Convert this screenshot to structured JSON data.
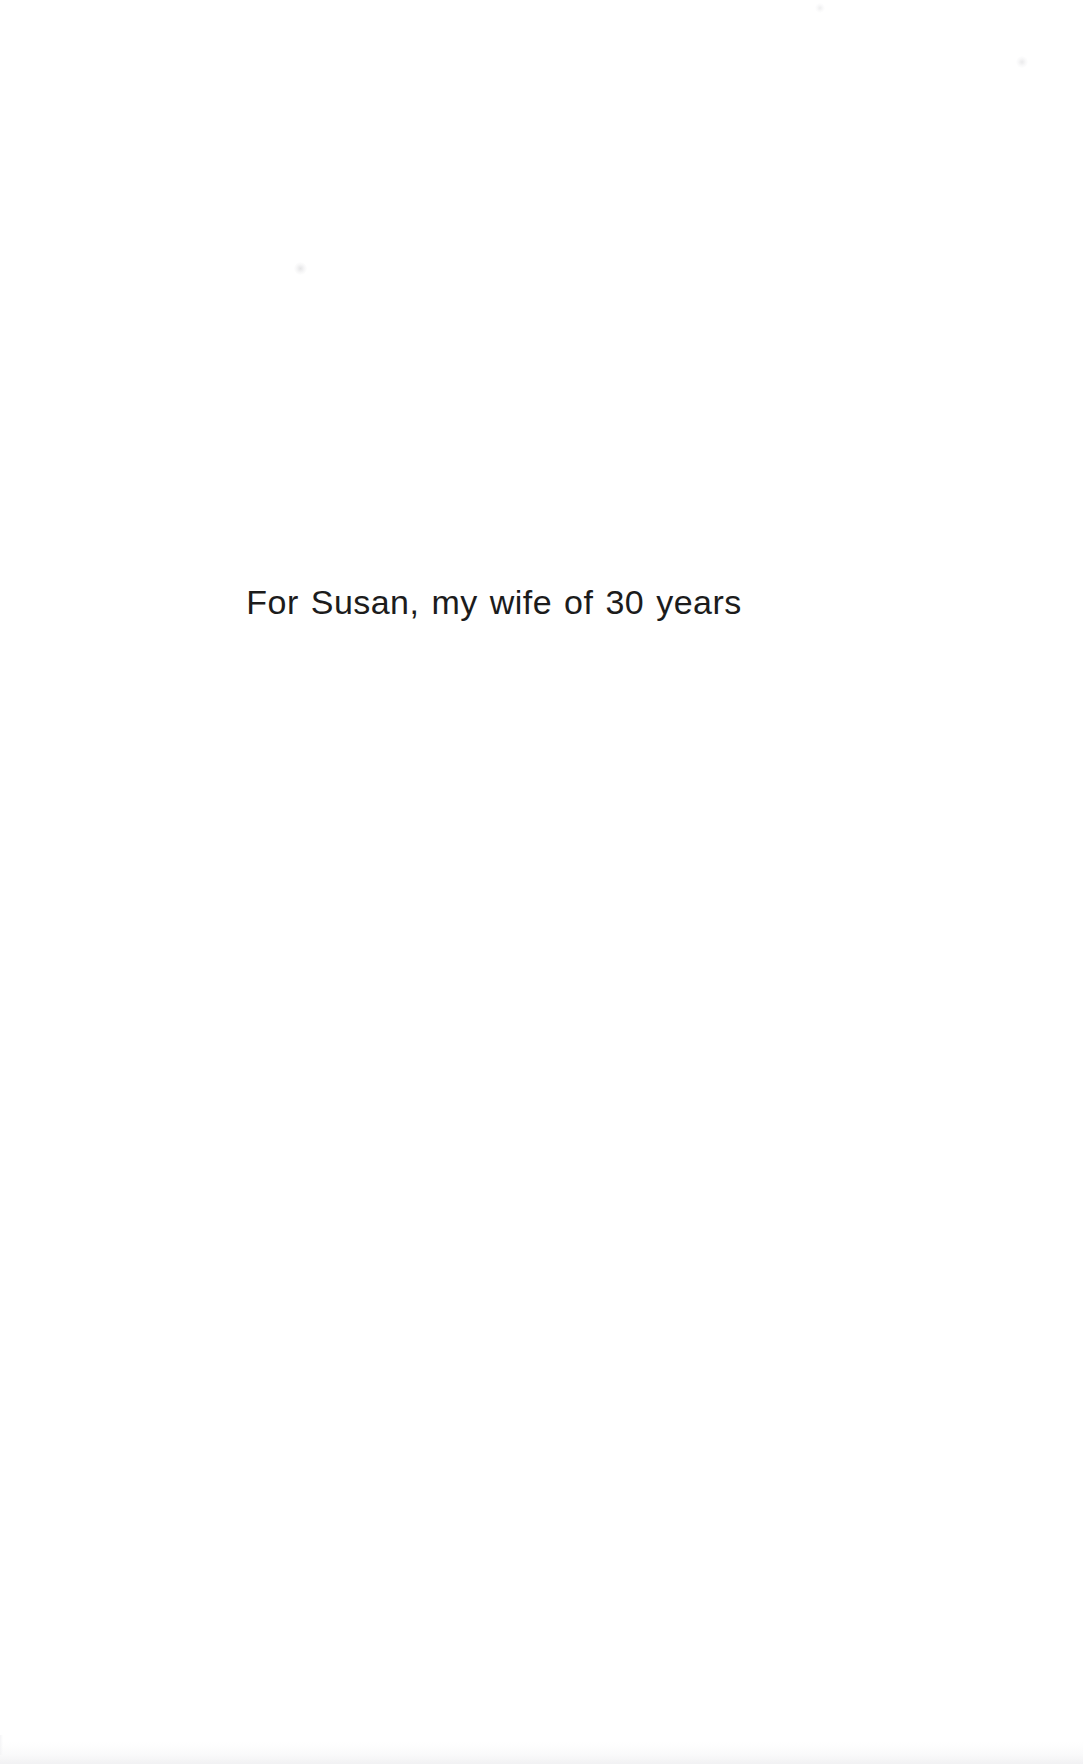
{
  "page": {
    "kind": "book-dedication-page",
    "width": 1083,
    "height": 1764,
    "background_color": "#ffffff"
  },
  "dedication": {
    "text": "For Susan, my wife of 30 years",
    "text_color": "#1c1c1c",
    "alignment": "center"
  },
  "artifacts": {
    "speck_1": "",
    "speck_2": "",
    "speck_3": "",
    "bottom_shadow": "",
    "left_edge": ""
  }
}
